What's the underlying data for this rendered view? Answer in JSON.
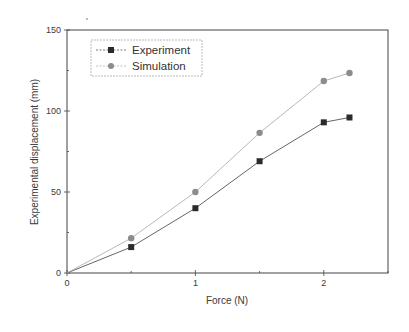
{
  "chart_data": {
    "type": "line",
    "title": "",
    "xlabel": "Force (N)",
    "ylabel": "Experimental displacement (mm)",
    "xlim": [
      0,
      2.5
    ],
    "ylim": [
      0,
      150
    ],
    "xticks": [
      0,
      1,
      2
    ],
    "yticks": [
      0,
      50,
      100,
      150
    ],
    "grid": false,
    "legend_position": "upper-left",
    "x": [
      0,
      0.5,
      1.0,
      1.5,
      2.0,
      2.2
    ],
    "series": [
      {
        "name": "Experiment",
        "marker": "square",
        "color": "#2b2b2b",
        "line_color": "#555555",
        "values": [
          0,
          16,
          40,
          69,
          93,
          96
        ]
      },
      {
        "name": "Simulation",
        "marker": "circle",
        "color": "#8c8c8c",
        "line_color": "#b0b0b0",
        "values": [
          0,
          21.5,
          50,
          86.5,
          118.5,
          123.5
        ]
      }
    ]
  },
  "legend": {
    "items": [
      {
        "label": "Experiment"
      },
      {
        "label": "Simulation"
      }
    ]
  },
  "axes": {
    "x_title": "Force (N)",
    "y_title": "Experimental displacement (mm)",
    "x_tick_labels": [
      "0",
      "1",
      "2"
    ],
    "y_tick_labels": [
      "0",
      "50",
      "100",
      "150"
    ]
  }
}
